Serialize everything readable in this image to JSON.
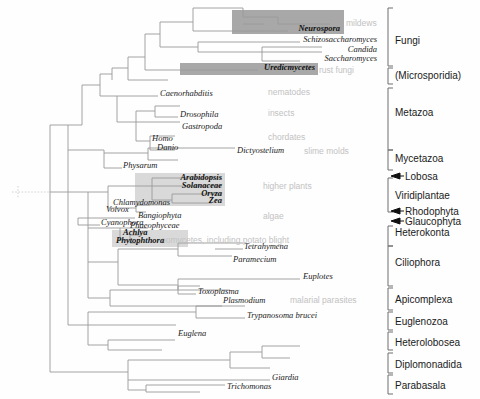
{
  "figure": {
    "type": "phylogenetic-tree",
    "title": "",
    "width": 480,
    "height": 399,
    "colors": {
      "branch": "#9a9a9a",
      "taxon_text": "#1a1a1a",
      "annotation_text": "#c2c2c2",
      "group_text": "#1a1a1a",
      "bracket": "#6e6e6e",
      "highlight_dark": "#a8a8a8",
      "highlight_light": "#d9d9d9",
      "background": "#ffffff"
    }
  },
  "taxa": [
    {
      "name": "Neurospora",
      "x": 340,
      "y": 31,
      "anchor": "end",
      "highlight": "dark"
    },
    {
      "name": "Schizosaccharomyces",
      "x": 377,
      "y": 42,
      "anchor": "end",
      "highlight": "none"
    },
    {
      "name": "Candida",
      "x": 377,
      "y": 52,
      "anchor": "end",
      "highlight": "none"
    },
    {
      "name": "Saccharomyces",
      "x": 377,
      "y": 61,
      "anchor": "end",
      "highlight": "none"
    },
    {
      "name": "Uredicmycetes",
      "x": 315,
      "y": 70,
      "anchor": "end",
      "highlight": "dark"
    },
    {
      "name": "Caenorhabditis",
      "x": 160,
      "y": 96,
      "anchor": "start",
      "highlight": "none"
    },
    {
      "name": "Drosophila",
      "x": 180,
      "y": 117,
      "anchor": "start",
      "highlight": "none"
    },
    {
      "name": "Gastropoda",
      "x": 182,
      "y": 129,
      "anchor": "start",
      "highlight": "none"
    },
    {
      "name": "Homo",
      "x": 152,
      "y": 141,
      "anchor": "start",
      "highlight": "none"
    },
    {
      "name": "Danio",
      "x": 157,
      "y": 150,
      "anchor": "start",
      "highlight": "none"
    },
    {
      "name": "Dictyostelium",
      "x": 237,
      "y": 153,
      "anchor": "start",
      "highlight": "none"
    },
    {
      "name": "Physarum",
      "x": 123,
      "y": 168,
      "anchor": "start",
      "highlight": "none"
    },
    {
      "name": "Arabidopsis",
      "x": 222,
      "y": 180,
      "anchor": "end",
      "highlight": "light"
    },
    {
      "name": "Solanaceae",
      "x": 222,
      "y": 188,
      "anchor": "end",
      "highlight": "light"
    },
    {
      "name": "Oryza",
      "x": 222,
      "y": 196,
      "anchor": "end",
      "highlight": "light"
    },
    {
      "name": "Zea",
      "x": 222,
      "y": 203,
      "anchor": "end",
      "highlight": "light"
    },
    {
      "name": "Chlamydomonas",
      "x": 113,
      "y": 205,
      "anchor": "start",
      "highlight": "none"
    },
    {
      "name": "Volvox",
      "x": 106,
      "y": 212,
      "anchor": "start",
      "highlight": "none"
    },
    {
      "name": "Bangiophyta",
      "x": 138,
      "y": 218,
      "anchor": "start",
      "highlight": "none"
    },
    {
      "name": "Cyanophora",
      "x": 101,
      "y": 225,
      "anchor": "start",
      "highlight": "none"
    },
    {
      "name": "Phaeophyceae",
      "x": 130,
      "y": 228,
      "anchor": "start",
      "highlight": "none"
    },
    {
      "name": "Achlya",
      "x": 123,
      "y": 235,
      "anchor": "start",
      "highlight": "light"
    },
    {
      "name": "Phytophthora",
      "x": 116,
      "y": 243,
      "anchor": "start",
      "highlight": "light"
    },
    {
      "name": "Tetrahymena",
      "x": 244,
      "y": 249,
      "anchor": "start",
      "highlight": "none"
    },
    {
      "name": "Paramecium",
      "x": 233,
      "y": 262,
      "anchor": "start",
      "highlight": "none"
    },
    {
      "name": "Euplotes",
      "x": 303,
      "y": 279,
      "anchor": "start",
      "highlight": "none"
    },
    {
      "name": "Toxoplasma",
      "x": 198,
      "y": 294,
      "anchor": "start",
      "highlight": "none"
    },
    {
      "name": "Plasmodium",
      "x": 223,
      "y": 303,
      "anchor": "start",
      "highlight": "none"
    },
    {
      "name": "Trypanosoma brucei",
      "x": 247,
      "y": 318,
      "anchor": "start",
      "highlight": "none"
    },
    {
      "name": "Euglena",
      "x": 178,
      "y": 336,
      "anchor": "start",
      "highlight": "none"
    },
    {
      "name": "Giardia",
      "x": 272,
      "y": 380,
      "anchor": "start",
      "highlight": "none"
    },
    {
      "name": "Trichomonas",
      "x": 227,
      "y": 389,
      "anchor": "start",
      "highlight": "none"
    }
  ],
  "annotations": [
    {
      "text": "mildews",
      "x": 346,
      "y": 26
    },
    {
      "text": "rust fungi",
      "x": 319,
      "y": 73
    },
    {
      "text": "nematodes",
      "x": 268,
      "y": 95
    },
    {
      "text": "insects",
      "x": 268,
      "y": 116
    },
    {
      "text": "chordates",
      "x": 268,
      "y": 140
    },
    {
      "text": "slime molds",
      "x": 304,
      "y": 154
    },
    {
      "text": "higher plants",
      "x": 263,
      "y": 189
    },
    {
      "text": "algae",
      "x": 263,
      "y": 219
    },
    {
      "text": "oomycetes, including potato blight",
      "x": 161,
      "y": 243
    },
    {
      "text": "malarial parasites",
      "x": 290,
      "y": 303
    }
  ],
  "groups": [
    {
      "label": "Lobosa",
      "y": 176,
      "label_x": 405,
      "type": "arrow",
      "top": 176,
      "bottom": 176
    },
    {
      "label": "Fungi",
      "y": 40,
      "label_x": 395,
      "type": "bracket",
      "top": 8,
      "bottom": 66
    },
    {
      "label": "(Microsporidia)",
      "y": 75,
      "label_x": 395,
      "type": "bracket",
      "top": 68,
      "bottom": 84
    },
    {
      "label": "Metazoa",
      "y": 112,
      "label_x": 395,
      "type": "bracket",
      "top": 88,
      "bottom": 150
    },
    {
      "label": "Mycetazoa",
      "y": 158,
      "label_x": 395,
      "type": "bracket",
      "top": 150,
      "bottom": 170
    },
    {
      "label": "Viridiplantae",
      "y": 195,
      "label_x": 395,
      "type": "bracket",
      "top": 178,
      "bottom": 212
    },
    {
      "label": "Rhodophyta",
      "y": 211,
      "label_x": 405,
      "type": "arrow",
      "top": 211,
      "bottom": 211
    },
    {
      "label": "Glaucophyta",
      "y": 221,
      "label_x": 405,
      "type": "arrow",
      "top": 221,
      "bottom": 221
    },
    {
      "label": "Heterokonta",
      "y": 232,
      "label_x": 395,
      "type": "bracket",
      "top": 226,
      "bottom": 246
    },
    {
      "label": "Ciliophora",
      "y": 262,
      "label_x": 395,
      "type": "bracket",
      "top": 246,
      "bottom": 286
    },
    {
      "label": "Apicomplexa",
      "y": 299,
      "label_x": 395,
      "type": "bracket",
      "top": 288,
      "bottom": 310
    },
    {
      "label": "Euglenozoa",
      "y": 321,
      "label_x": 395,
      "type": "bracket",
      "top": 312,
      "bottom": 330
    },
    {
      "label": "Heterolobosea",
      "y": 342,
      "label_x": 395,
      "type": "bracket",
      "top": 332,
      "bottom": 350
    },
    {
      "label": "Diplomonadida",
      "y": 364,
      "label_x": 395,
      "type": "bracket",
      "top": 353,
      "bottom": 373
    },
    {
      "label": "Parabasala",
      "y": 385,
      "label_x": 395,
      "type": "bracket",
      "top": 375,
      "bottom": 394
    }
  ],
  "highlight_boxes": [
    {
      "name": "neurospora-box",
      "x": 232,
      "y": 10,
      "w": 112,
      "h": 24,
      "shade": "dark"
    },
    {
      "name": "uredinomycetes-box",
      "x": 180,
      "y": 63,
      "w": 138,
      "h": 12,
      "shade": "dark"
    },
    {
      "name": "plants-box",
      "x": 135,
      "y": 173,
      "w": 90,
      "h": 33,
      "shade": "light"
    },
    {
      "name": "oomycetes-box",
      "x": 112,
      "y": 230,
      "w": 76,
      "h": 17,
      "shade": "light"
    }
  ],
  "branches": [
    [
      193,
      8,
      243,
      8
    ],
    [
      243,
      8,
      243,
      17
    ],
    [
      243,
      17,
      278,
      17
    ],
    [
      243,
      24,
      264,
      24
    ],
    [
      278,
      17,
      278,
      24
    ],
    [
      278,
      24,
      330,
      24
    ],
    [
      193,
      8,
      193,
      31
    ],
    [
      193,
      31,
      228,
      31
    ],
    [
      228,
      31,
      288,
      31
    ],
    [
      160,
      22,
      193,
      22
    ],
    [
      160,
      22,
      160,
      47
    ],
    [
      160,
      47,
      198,
      47
    ],
    [
      198,
      42,
      198,
      52
    ],
    [
      198,
      42,
      300,
      42
    ],
    [
      198,
      52,
      262,
      52
    ],
    [
      262,
      47,
      262,
      61
    ],
    [
      262,
      47,
      322,
      47
    ],
    [
      262,
      61,
      300,
      61
    ],
    [
      262,
      52,
      322,
      52
    ],
    [
      145,
      34,
      160,
      34
    ],
    [
      145,
      34,
      145,
      70
    ],
    [
      145,
      70,
      180,
      70
    ],
    [
      180,
      70,
      258,
      70
    ],
    [
      128,
      57,
      145,
      57
    ],
    [
      128,
      57,
      128,
      80
    ],
    [
      128,
      80,
      168,
      80
    ],
    [
      112,
      68,
      128,
      68
    ],
    [
      112,
      68,
      112,
      80
    ],
    [
      100,
      74,
      112,
      74
    ],
    [
      100,
      74,
      100,
      96
    ],
    [
      100,
      96,
      117,
      96
    ],
    [
      117,
      96,
      158,
      96
    ],
    [
      117,
      96,
      117,
      122
    ],
    [
      117,
      122,
      136,
      122
    ],
    [
      136,
      111,
      136,
      141
    ],
    [
      136,
      111,
      155,
      111
    ],
    [
      155,
      106,
      155,
      117
    ],
    [
      155,
      106,
      180,
      106
    ],
    [
      155,
      117,
      178,
      117
    ],
    [
      136,
      122,
      158,
      122
    ],
    [
      158,
      122,
      180,
      122
    ],
    [
      136,
      141,
      150,
      141
    ],
    [
      150,
      136,
      150,
      150
    ],
    [
      150,
      136,
      175,
      136
    ],
    [
      150,
      150,
      175,
      150
    ],
    [
      82,
      85,
      100,
      85
    ],
    [
      82,
      85,
      82,
      125
    ],
    [
      82,
      125,
      68,
      125
    ],
    [
      68,
      125,
      68,
      150
    ],
    [
      68,
      150,
      104,
      150
    ],
    [
      104,
      150,
      104,
      168
    ],
    [
      104,
      168,
      122,
      168
    ],
    [
      104,
      153,
      148,
      153
    ],
    [
      148,
      148,
      148,
      160
    ],
    [
      148,
      148,
      193,
      148
    ],
    [
      193,
      148,
      235,
      148
    ],
    [
      148,
      160,
      178,
      160
    ],
    [
      50,
      125,
      68,
      125
    ],
    [
      50,
      125,
      50,
      192
    ],
    [
      50,
      192,
      88,
      192
    ],
    [
      88,
      192,
      88,
      228
    ],
    [
      88,
      192,
      108,
      192
    ],
    [
      108,
      186,
      108,
      208
    ],
    [
      108,
      186,
      152,
      186
    ],
    [
      152,
      178,
      152,
      200
    ],
    [
      152,
      178,
      185,
      178
    ],
    [
      185,
      178,
      222,
      178
    ],
    [
      152,
      186,
      178,
      186
    ],
    [
      178,
      186,
      222,
      186
    ],
    [
      152,
      200,
      172,
      200
    ],
    [
      172,
      194,
      172,
      203
    ],
    [
      172,
      194,
      222,
      194
    ],
    [
      172,
      203,
      212,
      203
    ],
    [
      108,
      208,
      136,
      208
    ],
    [
      136,
      205,
      136,
      212
    ],
    [
      136,
      205,
      150,
      205
    ],
    [
      136,
      212,
      146,
      212
    ],
    [
      88,
      218,
      135,
      218
    ],
    [
      78,
      218,
      88,
      218
    ],
    [
      78,
      218,
      78,
      225
    ],
    [
      78,
      225,
      100,
      225
    ],
    [
      88,
      228,
      120,
      228
    ],
    [
      120,
      228,
      120,
      240
    ],
    [
      120,
      228,
      148,
      228
    ],
    [
      120,
      240,
      130,
      240
    ],
    [
      130,
      235,
      130,
      243
    ],
    [
      130,
      235,
      142,
      235
    ],
    [
      130,
      243,
      140,
      243
    ],
    [
      88,
      228,
      88,
      262
    ],
    [
      88,
      262,
      118,
      262
    ],
    [
      118,
      249,
      118,
      285
    ],
    [
      118,
      249,
      145,
      249
    ],
    [
      145,
      249,
      178,
      249
    ],
    [
      178,
      243,
      178,
      256
    ],
    [
      178,
      243,
      215,
      243
    ],
    [
      215,
      243,
      243,
      243
    ],
    [
      215,
      249,
      243,
      249
    ],
    [
      178,
      256,
      205,
      256
    ],
    [
      205,
      256,
      232,
      256
    ],
    [
      118,
      285,
      178,
      285
    ],
    [
      178,
      279,
      178,
      290
    ],
    [
      178,
      279,
      240,
      279
    ],
    [
      240,
      279,
      300,
      279
    ],
    [
      178,
      290,
      230,
      290
    ],
    [
      88,
      262,
      88,
      298
    ],
    [
      88,
      298,
      110,
      298
    ],
    [
      110,
      290,
      110,
      306
    ],
    [
      110,
      290,
      178,
      290
    ],
    [
      178,
      286,
      178,
      294
    ],
    [
      178,
      286,
      200,
      286
    ],
    [
      178,
      294,
      196,
      294
    ],
    [
      110,
      306,
      175,
      306
    ],
    [
      175,
      306,
      222,
      306
    ],
    [
      68,
      150,
      68,
      325
    ],
    [
      68,
      325,
      88,
      325
    ],
    [
      88,
      312,
      88,
      345
    ],
    [
      88,
      312,
      148,
      312
    ],
    [
      148,
      312,
      196,
      312
    ],
    [
      196,
      306,
      196,
      318
    ],
    [
      196,
      306,
      245,
      306
    ],
    [
      196,
      318,
      245,
      318
    ],
    [
      88,
      325,
      130,
      325
    ],
    [
      130,
      325,
      176,
      325
    ],
    [
      88,
      345,
      108,
      345
    ],
    [
      108,
      340,
      108,
      350
    ],
    [
      108,
      340,
      175,
      340
    ],
    [
      108,
      350,
      162,
      350
    ],
    [
      50,
      192,
      50,
      372
    ],
    [
      50,
      372,
      128,
      372
    ],
    [
      128,
      360,
      128,
      390
    ],
    [
      128,
      360,
      175,
      360
    ],
    [
      175,
      360,
      230,
      360
    ],
    [
      230,
      352,
      230,
      368
    ],
    [
      230,
      352,
      262,
      352
    ],
    [
      262,
      346,
      262,
      358
    ],
    [
      262,
      346,
      300,
      346
    ],
    [
      262,
      358,
      290,
      358
    ],
    [
      230,
      368,
      270,
      368
    ],
    [
      128,
      380,
      175,
      380
    ],
    [
      175,
      380,
      270,
      380
    ],
    [
      128,
      390,
      146,
      390
    ],
    [
      146,
      385,
      146,
      392
    ],
    [
      146,
      385,
      225,
      385
    ],
    [
      146,
      392,
      200,
      392
    ]
  ],
  "root_stub": {
    "x1": 12,
    "y1": 192,
    "x2": 50,
    "y2": 192
  }
}
